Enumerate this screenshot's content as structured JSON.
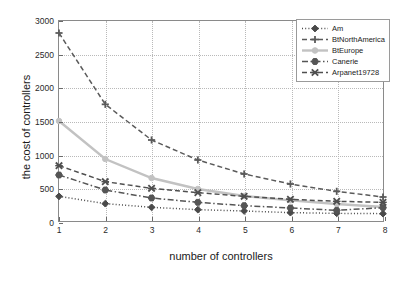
{
  "chart_data": {
    "type": "line",
    "title": "",
    "xlabel": "number of controllers",
    "ylabel": "the cost of controllers",
    "x": [
      1,
      2,
      3,
      4,
      5,
      6,
      7,
      8
    ],
    "xlim": [
      1,
      8
    ],
    "ylim": [
      0,
      3000
    ],
    "xticks": [
      "1",
      "2",
      "3",
      "4",
      "5",
      "6",
      "7",
      "8"
    ],
    "yticks": [
      "0",
      "500",
      "1000",
      "1500",
      "2000",
      "2500",
      "3000"
    ],
    "grid": true,
    "legend_position": "top-right",
    "series": [
      {
        "name": "Am",
        "values": [
          370,
          260,
          205,
          170,
          150,
          125,
          115,
          110
        ],
        "color": "#4a4a4a",
        "linestyle": "dotted",
        "marker": "diamond"
      },
      {
        "name": "BtNorthAmerica",
        "values": [
          2820,
          1750,
          1215,
          915,
          705,
          555,
          445,
          360
        ],
        "color": "#5a5a5a",
        "linestyle": "dashed",
        "marker": "plus"
      },
      {
        "name": "BtEurope",
        "values": [
          1500,
          930,
          645,
          480,
          375,
          310,
          255,
          210
        ],
        "color": "#c2c2c2",
        "linestyle": "solid",
        "marker": "circle"
      },
      {
        "name": "Canerie",
        "values": [
          690,
          465,
          345,
          280,
          230,
          195,
          160,
          200
        ],
        "color": "#555555",
        "linestyle": "dashdot",
        "marker": "hexagon"
      },
      {
        "name": "Arpanet19728",
        "values": [
          830,
          590,
          490,
          425,
          370,
          325,
          295,
          280
        ],
        "color": "#4f4f4f",
        "linestyle": "dashed",
        "marker": "cross"
      }
    ]
  },
  "legend": {
    "entries": [
      {
        "label": "Am"
      },
      {
        "label": "BtNorthAmerica"
      },
      {
        "label": "BtEurope"
      },
      {
        "label": "Canerie"
      },
      {
        "label": "Arpanet19728"
      }
    ]
  }
}
